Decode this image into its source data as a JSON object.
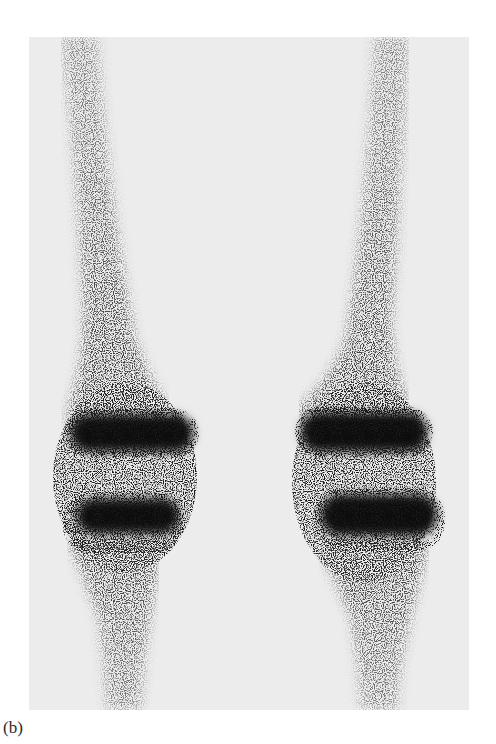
{
  "figure": {
    "panel_label": "(b)",
    "background_color": "#ececec",
    "uptake_color": "#111111",
    "subjects": [
      {
        "name": "left-knee",
        "bands": 2
      },
      {
        "name": "right-knee",
        "bands": 2
      }
    ]
  }
}
